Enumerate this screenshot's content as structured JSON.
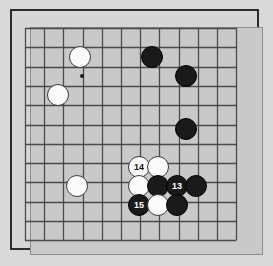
{
  "diagram": {
    "type": "go-board-diagram",
    "board": {
      "columns": 12,
      "rows": 12,
      "grid_origin_x": 25,
      "grid_origin_y": 28,
      "grid_step_x": 19.2,
      "grid_step_y": 19.3,
      "board_color": "#c9c9c9",
      "line_color": "#4a4a4a",
      "frame_color": "#2b2b2b",
      "page_background": "#d9d9d9"
    },
    "star_points": [
      {
        "name": "hoshi-upper-left",
        "x": 82,
        "y": 76
      }
    ],
    "stones": [
      {
        "id": "w-a",
        "color": "white",
        "label": "",
        "x": 80,
        "y": 57,
        "r": 11
      },
      {
        "id": "w-b",
        "color": "white",
        "label": "",
        "x": 58,
        "y": 95,
        "r": 11
      },
      {
        "id": "b-a",
        "color": "black",
        "label": "",
        "x": 152,
        "y": 57,
        "r": 11
      },
      {
        "id": "b-b",
        "color": "black",
        "label": "",
        "x": 186,
        "y": 76,
        "r": 11
      },
      {
        "id": "b-c",
        "color": "black",
        "label": "",
        "x": 186,
        "y": 129,
        "r": 11
      },
      {
        "id": "w-c",
        "color": "white",
        "label": "",
        "x": 77,
        "y": 186,
        "r": 11
      },
      {
        "id": "w-14",
        "color": "white",
        "label": "14",
        "x": 139,
        "y": 167,
        "r": 11
      },
      {
        "id": "w-d",
        "color": "white",
        "label": "",
        "x": 158,
        "y": 167,
        "r": 11
      },
      {
        "id": "w-e",
        "color": "white",
        "label": "",
        "x": 139,
        "y": 186,
        "r": 11
      },
      {
        "id": "b-d",
        "color": "black",
        "label": "",
        "x": 158,
        "y": 186,
        "r": 11
      },
      {
        "id": "b-13",
        "color": "black",
        "label": "13",
        "x": 177,
        "y": 186,
        "r": 11
      },
      {
        "id": "b-e",
        "color": "black",
        "label": "",
        "x": 196,
        "y": 186,
        "r": 11
      },
      {
        "id": "b-15",
        "color": "black",
        "label": "15",
        "x": 139,
        "y": 205,
        "r": 11
      },
      {
        "id": "w-f",
        "color": "white",
        "label": "",
        "x": 158,
        "y": 205,
        "r": 11
      },
      {
        "id": "b-f",
        "color": "black",
        "label": "",
        "x": 177,
        "y": 205,
        "r": 11
      }
    ],
    "move_numbers": [
      "13",
      "14",
      "15"
    ]
  }
}
